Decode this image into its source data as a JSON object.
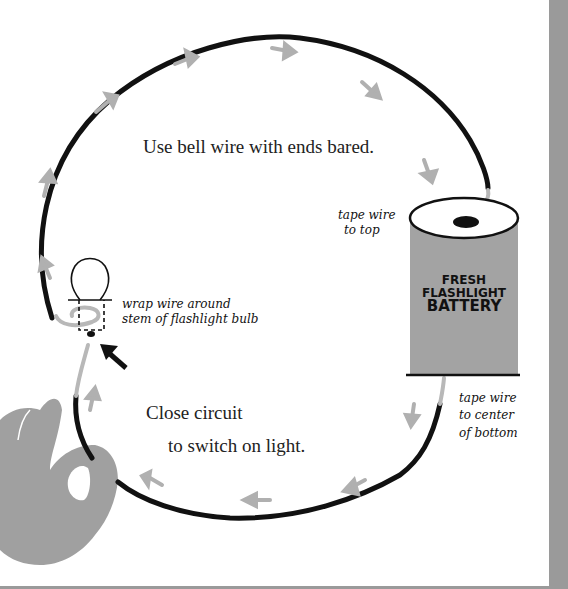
{
  "diagram": {
    "title": "Use bell wire with ends bared.",
    "instruction_line1": "Close circuit",
    "instruction_line2": "to switch on light.",
    "labels": {
      "top_tape": {
        "line1": "tape wire",
        "line2": "to top"
      },
      "bulb": {
        "line1": "wrap wire around",
        "line2": "stem of flashlight bulb"
      },
      "bottom_tape": {
        "line1": "tape wire",
        "line2": "to center",
        "line3": "of bottom"
      }
    },
    "battery": {
      "line1": "FRESH",
      "line2": "FLASHLIGHT",
      "line3": "BATTERY"
    },
    "components": [
      "wire-loop",
      "flashlight-bulb",
      "battery",
      "hand",
      "current-arrows",
      "pointer-arrow"
    ],
    "colors": {
      "wire": "#111111",
      "bare_wire": "#b8b8b8",
      "arrow": "#b0b0b0",
      "battery": "#a3a3a3",
      "hand": "#a0a0a0",
      "page_edge": "#9a9a9a"
    }
  }
}
